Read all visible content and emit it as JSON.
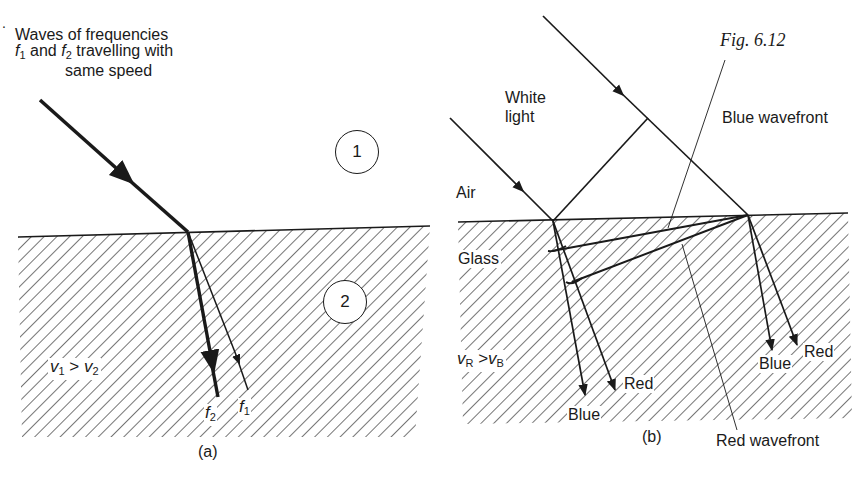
{
  "figure": {
    "number": "Fig. 6.12",
    "panel_a": {
      "caption": "(a)",
      "heading_line1": "Waves of frequencies",
      "heading_line2_f1": "f",
      "heading_line2_f1_sub": "1",
      "heading_line2_and": " and ",
      "heading_line2_f2": "f",
      "heading_line2_f2_sub": "2",
      "heading_line2_rest": " travelling with",
      "heading_line3": "same speed",
      "medium1_label": "1",
      "medium2_label": "2",
      "speed_relation": {
        "v1": "v",
        "v1_sub": "1",
        "op": " > ",
        "v2": "v",
        "v2_sub": "2"
      },
      "ray_labels": {
        "f2": "f",
        "f2_sub": "2",
        "f1": "f",
        "f1_sub": "1"
      }
    },
    "panel_b": {
      "caption": "(b)",
      "white_light_line1": "White",
      "white_light_line2": "light",
      "air_label": "Air",
      "glass_label": "Glass",
      "speed_relation": {
        "vR": "v",
        "vR_sub": "R",
        "op": " >",
        "vB": "v",
        "vB_sub": "B"
      },
      "blue_wavefront": "Blue wavefront",
      "red_wavefront": "Red wavefront",
      "left_rays": {
        "blue": "Blue",
        "red": "Red"
      },
      "right_rays": {
        "blue": "Blue",
        "red": "Red"
      }
    }
  },
  "colors": {
    "ink": "#1a1a1a",
    "background": "#ffffff",
    "hatch": "#2a2a2a"
  }
}
